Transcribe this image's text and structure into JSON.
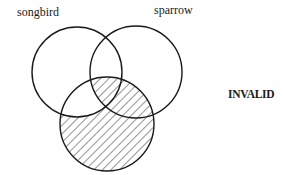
{
  "diagram": {
    "type": "venn-3",
    "sets": [
      {
        "id": "left",
        "label": "songbird"
      },
      {
        "id": "right",
        "label": "sparrow"
      },
      {
        "id": "bottom",
        "label": ""
      }
    ],
    "shaded_regions": [
      "bottom only",
      "bottom ∩ right only",
      "left ∩ right ∩ bottom"
    ],
    "unshaded_regions": [
      "left only",
      "right only",
      "left ∩ right only",
      "left ∩ bottom only"
    ],
    "verdict": "INVALID",
    "colors": {
      "stroke": "#1a1a1a",
      "hatch": "#2a2a2a",
      "background": "#ffffff"
    }
  }
}
